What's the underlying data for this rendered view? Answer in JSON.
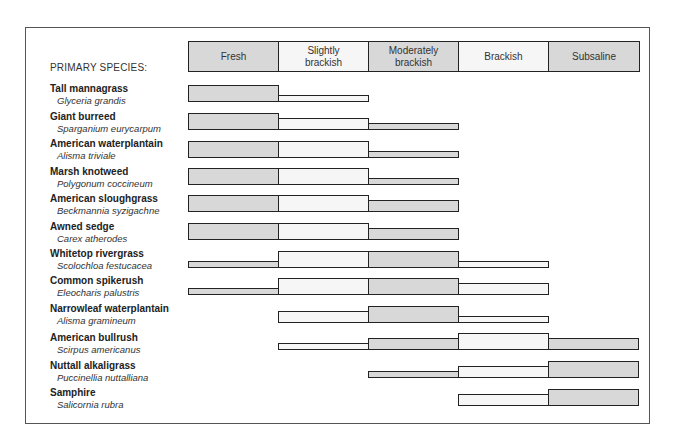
{
  "header": {
    "primary_species_label": "PRIMARY SPECIES:",
    "columns": [
      {
        "label": "Fresh",
        "fill": "gray"
      },
      {
        "label": "Slightly\nbrackish",
        "fill": "light"
      },
      {
        "label": "Moderately\nbrackish",
        "fill": "gray"
      },
      {
        "label": "Brackish",
        "fill": "light"
      },
      {
        "label": "Subsaline",
        "fill": "gray"
      }
    ]
  },
  "colors": {
    "gray": "#d8d8d8",
    "light": "#f6f6f6",
    "stroke": "#222222"
  },
  "chart_data": {
    "type": "table",
    "title": "",
    "row_header": "PRIMARY SPECIES:",
    "categories": [
      "Fresh",
      "Slightly brackish",
      "Moderately brackish",
      "Brackish",
      "Subsaline"
    ],
    "value_scale": "0 = absent, 1 = thin bar (occasional), 2 = medium bar (common), 3 = full bar (abundant)",
    "series": [
      {
        "name": "Tall mannagrass",
        "scientific": "Glyceria grandis",
        "values": [
          3,
          1,
          0,
          0,
          0
        ]
      },
      {
        "name": "Giant burreed",
        "scientific": "Sparganium eurycarpum",
        "values": [
          3,
          2,
          1,
          0,
          0
        ]
      },
      {
        "name": "American waterplantain",
        "scientific": "Alisma triviale",
        "values": [
          3,
          3,
          1,
          0,
          0
        ]
      },
      {
        "name": "Marsh knotweed",
        "scientific": "Polygonum coccineum",
        "values": [
          3,
          3,
          1,
          0,
          0
        ]
      },
      {
        "name": "American sloughgrass",
        "scientific": "Beckmannia syzigachne",
        "values": [
          3,
          3,
          2,
          0,
          0
        ]
      },
      {
        "name": "Awned sedge",
        "scientific": "Carex atherodes",
        "values": [
          3,
          3,
          2,
          0,
          0
        ]
      },
      {
        "name": "Whitetop rivergrass",
        "scientific": "Scolochloa festucacea",
        "values": [
          1,
          3,
          3,
          1,
          0
        ]
      },
      {
        "name": "Common spikerush",
        "scientific": "Eleocharis palustris",
        "values": [
          1,
          3,
          3,
          2,
          0
        ]
      },
      {
        "name": "Narrowleaf waterplantain",
        "scientific": "Alisma gramineum",
        "values": [
          0,
          2,
          3,
          1,
          0
        ]
      },
      {
        "name": "American bullrush",
        "scientific": "Scirpus americanus",
        "values": [
          0,
          1,
          2,
          3,
          2
        ]
      },
      {
        "name": "Nuttall alkaligrass",
        "scientific": "Puccinellia nuttalliana",
        "values": [
          0,
          0,
          1,
          2,
          3
        ]
      },
      {
        "name": "Samphire",
        "scientific": "Salicornia rubra",
        "values": [
          0,
          0,
          0,
          2,
          3
        ]
      }
    ]
  }
}
